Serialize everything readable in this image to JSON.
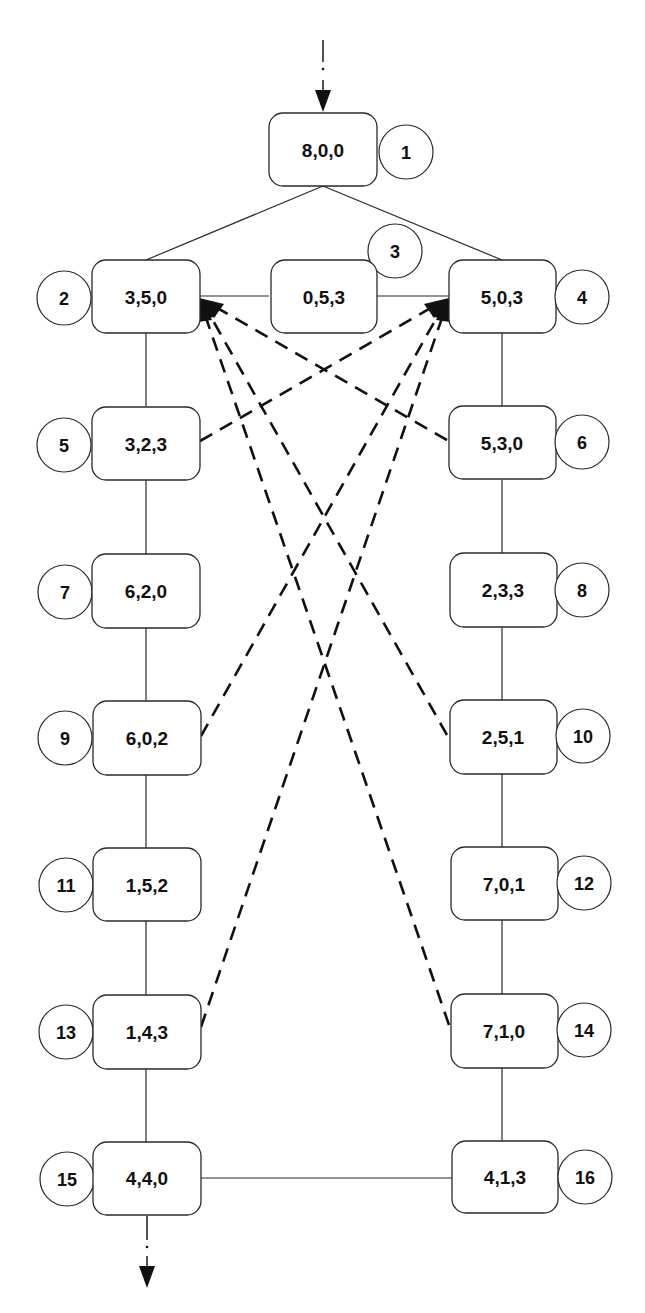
{
  "diagram": {
    "title": "",
    "colors": {
      "line": "#2a2a2a",
      "dash": "#111111",
      "background": "#ffffff"
    },
    "nodes": [
      {
        "id": "1",
        "state": "8,0,0"
      },
      {
        "id": "2",
        "state": "3,5,0"
      },
      {
        "id": "3",
        "state": "0,5,3"
      },
      {
        "id": "4",
        "state": "5,0,3"
      },
      {
        "id": "5",
        "state": "3,2,3"
      },
      {
        "id": "6",
        "state": "5,3,0"
      },
      {
        "id": "7",
        "state": "6,2,0"
      },
      {
        "id": "8",
        "state": "2,3,3"
      },
      {
        "id": "9",
        "state": "6,0,2"
      },
      {
        "id": "10",
        "state": "2,5,1"
      },
      {
        "id": "11",
        "state": "1,5,2"
      },
      {
        "id": "12",
        "state": "7,0,1"
      },
      {
        "id": "13",
        "state": "1,4,3"
      },
      {
        "id": "14",
        "state": "7,1,0"
      },
      {
        "id": "15",
        "state": "4,4,0"
      },
      {
        "id": "16",
        "state": "4,1,3"
      }
    ],
    "solid_edges": [
      [
        "1",
        "2"
      ],
      [
        "1",
        "4"
      ],
      [
        "2",
        "3"
      ],
      [
        "3",
        "4"
      ],
      [
        "2",
        "5"
      ],
      [
        "5",
        "7"
      ],
      [
        "7",
        "9"
      ],
      [
        "9",
        "11"
      ],
      [
        "11",
        "13"
      ],
      [
        "13",
        "15"
      ],
      [
        "4",
        "6"
      ],
      [
        "6",
        "8"
      ],
      [
        "8",
        "10"
      ],
      [
        "10",
        "12"
      ],
      [
        "12",
        "14"
      ],
      [
        "14",
        "16"
      ],
      [
        "15",
        "16"
      ]
    ],
    "dashed_arrows": [
      {
        "from": "6",
        "to": "2"
      },
      {
        "from": "10",
        "to": "2"
      },
      {
        "from": "14",
        "to": "2"
      },
      {
        "from": "5",
        "to": "4"
      },
      {
        "from": "9",
        "to": "4"
      },
      {
        "from": "13",
        "to": "4"
      }
    ],
    "entry_arrow": {
      "to": "1"
    },
    "exit_arrow": {
      "from": "15"
    }
  }
}
